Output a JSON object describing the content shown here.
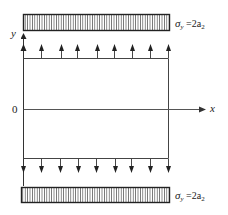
{
  "diagram": {
    "type": "stress-loaded plate",
    "axes": {
      "x_label": "x",
      "y_label": "y",
      "origin_label": "0"
    },
    "top_load": {
      "label_sigma": "σ",
      "label_sub": "y",
      "label_eq": " =2a",
      "label_eq_sub": "2"
    },
    "bottom_load": {
      "label_sigma": "σ",
      "label_sub": "y",
      "label_eq": " =2a",
      "label_eq_sub": "2"
    },
    "top_arrows_x": [
      23,
      41,
      61,
      77,
      97,
      114,
      132,
      150,
      168
    ],
    "bottom_arrows_x": [
      23,
      41,
      60,
      78,
      96,
      115,
      131,
      150,
      168
    ],
    "colors": {
      "line": "#333333",
      "hatch": "#444444",
      "background": "#ffffff"
    }
  }
}
